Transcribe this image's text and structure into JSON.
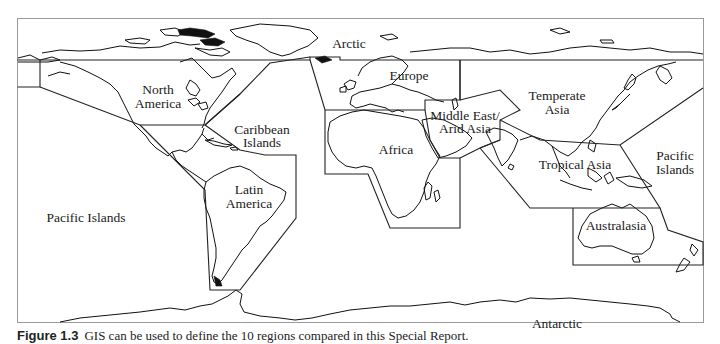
{
  "figure": {
    "type": "world-region-map",
    "labels": {
      "arctic": "Arctic",
      "north_america_1": "North",
      "north_america_2": "America",
      "europe": "Europe",
      "temperate_asia_1": "Temperate",
      "temperate_asia_2": "Asia",
      "caribbean_1": "Caribbean",
      "caribbean_2": "Islands",
      "middle_east_1": "Middle East/",
      "middle_east_2": "Arid Asia",
      "africa": "Africa",
      "latin_america_1": "Latin",
      "latin_america_2": "America",
      "tropical_asia": "Tropical Asia",
      "pacific_islands_east_1": "Pacific",
      "pacific_islands_east_2": "Islands",
      "pacific_islands_west": "Pacific Islands",
      "australasia": "Australasia",
      "antarctic": "Antarctic"
    },
    "regions": [
      "Arctic",
      "North America",
      "Europe",
      "Temperate Asia",
      "Caribbean Islands",
      "Middle East/Arid Asia",
      "Africa",
      "Latin America",
      "Tropical Asia",
      "Pacific Islands",
      "Australasia",
      "Antarctic"
    ]
  },
  "caption": {
    "number": "Figure 1.3",
    "text": "GIS can be used to define the 10 regions compared in this Special Report."
  }
}
